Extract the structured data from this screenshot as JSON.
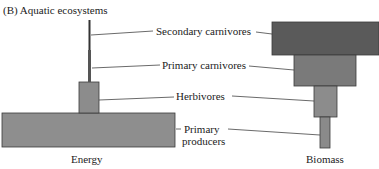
{
  "title": "(B) Aquatic ecosystems",
  "labels": {
    "secondary_carnivores": "Secondary carnivores",
    "primary_carnivores": "Primary carnivores",
    "herbivores": "Herbivores",
    "primary_producers_line1": "Primary",
    "primary_producers_line2": "producers"
  },
  "axis_labels": {
    "energy": "Energy",
    "biomass": "Biomass"
  },
  "colors": {
    "secondary_carnivores": "#5a5a5a",
    "primary_carnivores": "#7a7a7a",
    "herbivores": "#8c8c8c",
    "producers_energy": "#8e8e8e",
    "producers_biomass": "#8a8a8a",
    "outline": "#3a3a3a"
  }
}
